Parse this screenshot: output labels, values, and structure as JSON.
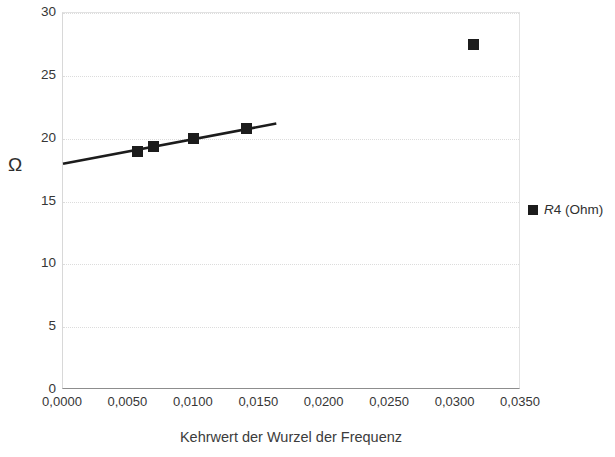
{
  "chart_data": {
    "type": "scatter",
    "title": "",
    "xlabel": "Kehrwert der Wurzel der Frequenz",
    "ylabel": "Ω",
    "xlim": [
      0.0,
      0.035
    ],
    "ylim": [
      0,
      30
    ],
    "grid": true,
    "legend_position": "right",
    "x_tick_labels": [
      "0,0000",
      "0,0050",
      "0,0100",
      "0,0150",
      "0,0200",
      "0,0250",
      "0,0300",
      "0,0350"
    ],
    "x_tick_values": [
      0.0,
      0.005,
      0.01,
      0.015,
      0.02,
      0.025,
      0.03,
      0.035
    ],
    "y_tick_labels": [
      "30",
      "25",
      "20",
      "15",
      "10",
      "5",
      "0"
    ],
    "y_tick_values": [
      30,
      25,
      20,
      15,
      10,
      5,
      0
    ],
    "series": [
      {
        "name": "R4 (Ohm)",
        "name_italic_part": "R",
        "name_rest": "4 (Ohm)",
        "marker": "filled-square",
        "color": "#1c1c1c",
        "points": [
          {
            "x": 0.0057,
            "y": 19.0
          },
          {
            "x": 0.0069,
            "y": 19.4
          },
          {
            "x": 0.01,
            "y": 20.0
          },
          {
            "x": 0.014,
            "y": 20.8
          },
          {
            "x": 0.0314,
            "y": 27.5
          }
        ]
      }
    ],
    "trendline": {
      "type": "linear",
      "color": "#1c1c1c",
      "x_start": 0.0,
      "y_start": 18.0,
      "x_end": 0.0163,
      "y_end": 21.2
    }
  },
  "axes": {
    "y_ticks": [
      {
        "label": "30",
        "value": 30
      },
      {
        "label": "25",
        "value": 25
      },
      {
        "label": "20",
        "value": 20
      },
      {
        "label": "15",
        "value": 15
      },
      {
        "label": "10",
        "value": 10
      },
      {
        "label": "5",
        "value": 5
      },
      {
        "label": "0",
        "value": 0
      }
    ],
    "x_ticks": [
      {
        "label": "0,0000",
        "value": 0.0
      },
      {
        "label": "0,0050",
        "value": 0.005
      },
      {
        "label": "0,0100",
        "value": 0.01
      },
      {
        "label": "0,0150",
        "value": 0.015
      },
      {
        "label": "0,0200",
        "value": 0.02
      },
      {
        "label": "0,0250",
        "value": 0.025
      },
      {
        "label": "0,0300",
        "value": 0.03
      },
      {
        "label": "0,0350",
        "value": 0.035
      }
    ],
    "y_title": "Ω",
    "x_title": "Kehrwert der Wurzel der Frequenz"
  },
  "legend": {
    "entries": [
      {
        "label": "R4 (Ohm)",
        "italic_prefix": "R",
        "plain_suffix": "4 (Ohm)",
        "color": "#1c1c1c"
      }
    ]
  }
}
